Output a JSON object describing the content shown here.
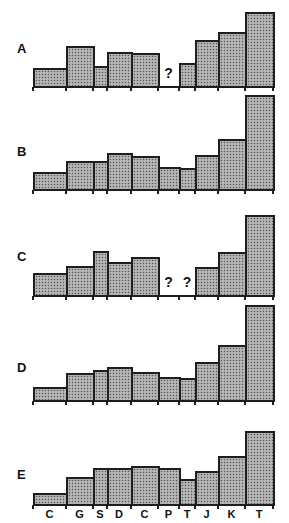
{
  "chart_data": {
    "type": "bar",
    "note": "Five stacked panels (A-E) of variable-width bars sharing the same category axis; '?' marks missing values",
    "categories": [
      "C",
      "G",
      "S",
      "D",
      "C",
      "P",
      "T",
      "J",
      "K",
      "T"
    ],
    "bar_edges_px": [
      33,
      66,
      93,
      107,
      131,
      158,
      179,
      195,
      218,
      245,
      273
    ],
    "series": [
      {
        "name": "A",
        "values": [
          19,
          41,
          21,
          35,
          34,
          null,
          24,
          47,
          55,
          75
        ],
        "missing_label": "?"
      },
      {
        "name": "B",
        "values": [
          18,
          29,
          29,
          37,
          34,
          23,
          22,
          35,
          51,
          95
        ]
      },
      {
        "name": "C",
        "values": [
          23,
          30,
          45,
          34,
          39,
          null,
          null,
          29,
          44,
          81
        ],
        "missing_label": "?"
      },
      {
        "name": "D",
        "values": [
          14,
          28,
          31,
          34,
          29,
          24,
          23,
          39,
          56,
          96
        ]
      },
      {
        "name": "E",
        "values": [
          12,
          28,
          37,
          37,
          39,
          37,
          26,
          34,
          49,
          74
        ]
      }
    ],
    "title": "",
    "xlabel": "",
    "ylabel": "",
    "grid": false,
    "legend": "none"
  },
  "panels": [
    {
      "label": "A",
      "baseline_y": 87,
      "label_y": 41
    },
    {
      "label": "B",
      "baseline_y": 190,
      "label_y": 144
    },
    {
      "label": "C",
      "baseline_y": 296,
      "label_y": 249
    },
    {
      "label": "D",
      "baseline_y": 401,
      "label_y": 360
    },
    {
      "label": "E",
      "baseline_y": 505,
      "label_y": 467
    }
  ],
  "missing_marker": "?",
  "axis_labels": [
    "C",
    "G",
    "S",
    "D",
    "C",
    "P",
    "T",
    "J",
    "K",
    "T"
  ],
  "colors": {
    "bar_fill": "#a8a8a8",
    "bar_outline": "#1e1e1e",
    "background": "#ffffff"
  }
}
